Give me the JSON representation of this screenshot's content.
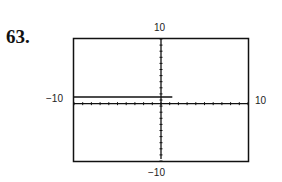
{
  "problem_number": "63.",
  "chart_data": {
    "type": "line",
    "title": "",
    "xlabel": "",
    "ylabel": "",
    "xlim": [
      -10,
      10
    ],
    "ylim": [
      -10,
      10
    ],
    "tick_labels": {
      "x_min": "−10",
      "x_max": "10",
      "y_min": "−10",
      "y_max": "10"
    },
    "grid": false,
    "series": [
      {
        "name": "graph",
        "x": [
          -10,
          1.3
        ],
        "y": [
          0.5,
          0.5
        ]
      }
    ]
  }
}
